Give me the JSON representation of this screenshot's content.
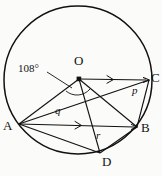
{
  "figure": {
    "name": "circle-vector-diagram",
    "background_color": "#fbfbfa",
    "stroke_color": "#111111",
    "circle": {
      "cx": 78,
      "cy": 80,
      "r": 74
    },
    "points": [
      {
        "id": "O",
        "label": "O",
        "x": 79,
        "y": 79,
        "label_x": 74,
        "label_y": 60,
        "marker": true
      },
      {
        "id": "C",
        "label": "C",
        "x": 149,
        "y": 80,
        "label_x": 152,
        "label_y": 73,
        "marker": false
      },
      {
        "id": "A",
        "label": "A",
        "x": 19,
        "y": 124,
        "label_x": 4,
        "label_y": 121,
        "marker": false
      },
      {
        "id": "B",
        "label": "B",
        "x": 137,
        "y": 127,
        "label_x": 142,
        "label_y": 123,
        "marker": false
      },
      {
        "id": "D",
        "label": "D",
        "x": 100,
        "y": 153,
        "label_x": 103,
        "label_y": 155,
        "marker": false
      }
    ],
    "vector_labels": [
      {
        "id": "p",
        "label": "p",
        "x": 134,
        "y": 91
      },
      {
        "id": "q",
        "label": "q",
        "x": 56,
        "y": 110
      },
      {
        "id": "r",
        "label": "r",
        "x": 97,
        "y": 135
      }
    ],
    "angle": {
      "label": "108°",
      "value": 108,
      "unit": "degrees",
      "vertex": "O",
      "label_x": 22,
      "label_y": 68,
      "leader_from_x": 50,
      "leader_from_y": 74,
      "leader_to_x": 70,
      "leader_to_y": 86
    },
    "segments": [
      {
        "id": "O-C",
        "from": "O",
        "to": "C",
        "arrow": true
      },
      {
        "id": "A-B",
        "from": "A",
        "to": "B",
        "arrow": true
      },
      {
        "id": "O-A",
        "from": "O",
        "to": "A",
        "arrow": false
      },
      {
        "id": "O-B",
        "from": "O",
        "to": "B",
        "arrow": false
      },
      {
        "id": "O-D",
        "from": "O",
        "to": "D",
        "arrow": false
      },
      {
        "id": "A-C",
        "from": "A",
        "to": "C",
        "arrow": false
      },
      {
        "id": "A-D",
        "from": "A",
        "to": "D",
        "arrow": false
      },
      {
        "id": "C-B",
        "from": "C",
        "to": "B",
        "arrow": false
      },
      {
        "id": "D-B",
        "from": "D",
        "to": "B",
        "arrow": false
      }
    ]
  }
}
